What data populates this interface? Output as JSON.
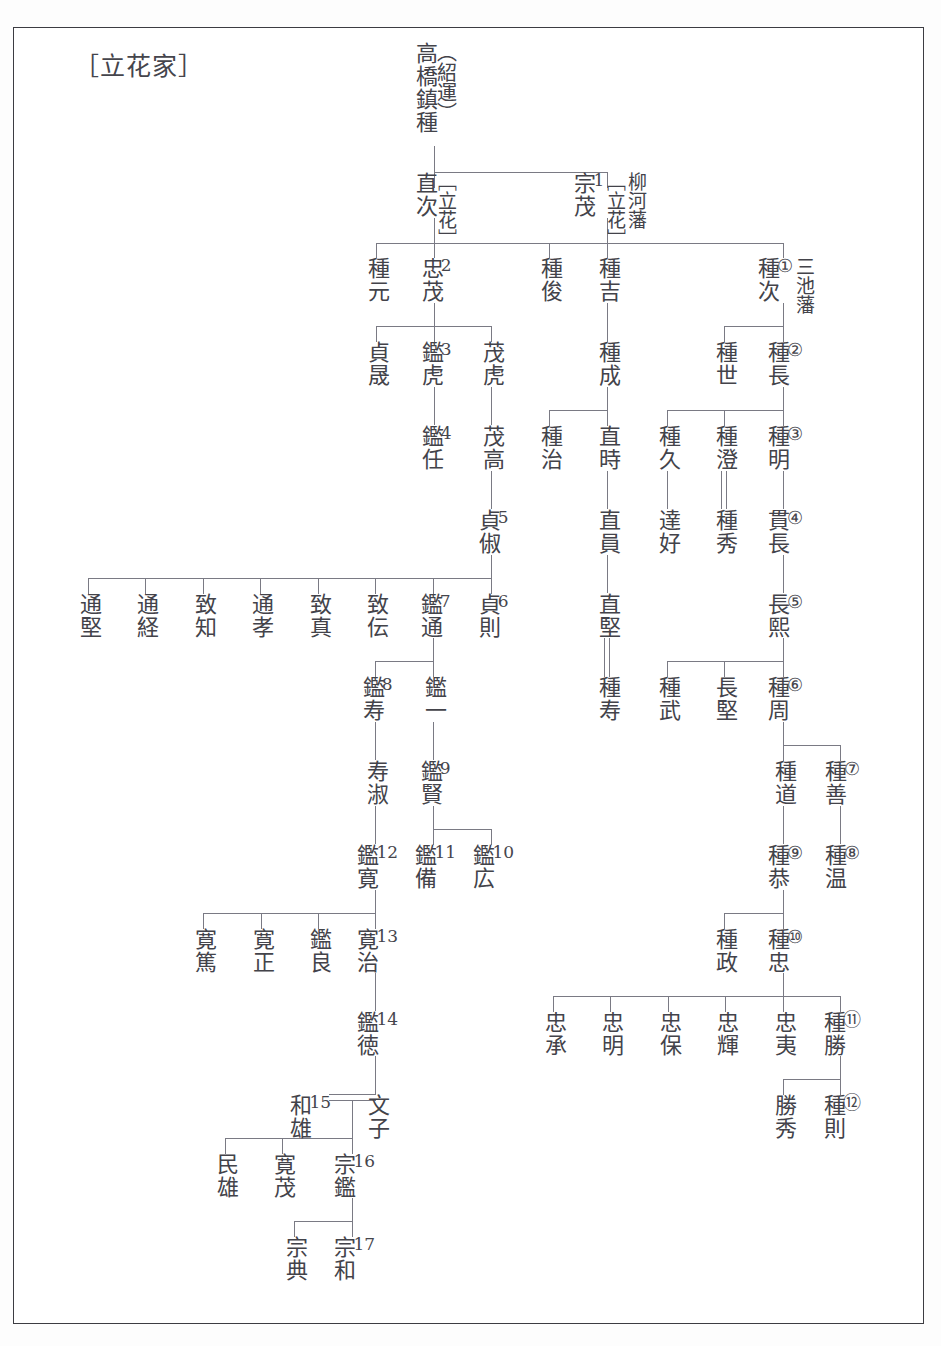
{
  "document": {
    "title": "［立花家］",
    "type": "family-tree",
    "orientation": "vertical-japanese"
  },
  "legend": {
    "domain_label_yanagawa": "柳河藩",
    "domain_label_miike": "三池藩",
    "surname_bracket": "［立花］"
  },
  "nodes": {
    "root": {
      "name": "高橋鎮種",
      "alt": "（紹運）"
    },
    "naotsugu": {
      "name": "直次",
      "tag": "［立花］"
    },
    "muneshige": {
      "name": "宗茂",
      "gen": "1",
      "tag": "［立花］",
      "tag2": "柳河藩"
    },
    "tanemoto": {
      "name": "種元"
    },
    "tadashige": {
      "name": "忠茂",
      "gen": "2"
    },
    "tanetoshi": {
      "name": "種俊"
    },
    "taneyoshi": {
      "name": "種吉"
    },
    "tanetsugu": {
      "name": "種次",
      "circ": "①",
      "tag2": "三池藩"
    },
    "sadaakira": {
      "name": "貞晟"
    },
    "akitora": {
      "name": "鑑虎",
      "gen": "3"
    },
    "shigetora": {
      "name": "茂虎"
    },
    "tanenari": {
      "name": "種成"
    },
    "taneyo": {
      "name": "種世"
    },
    "tanenaga": {
      "name": "種長",
      "circ": "②"
    },
    "akitou": {
      "name": "鑑任",
      "gen": "4"
    },
    "shigetaka": {
      "name": "茂高"
    },
    "taneharu": {
      "name": "種治"
    },
    "naotoki": {
      "name": "直時"
    },
    "tanehisa": {
      "name": "種久"
    },
    "tanesumi": {
      "name": "種澄"
    },
    "taneaki": {
      "name": "種明",
      "circ": "③"
    },
    "sadayoshi": {
      "name": "貞俶",
      "gen": "5"
    },
    "naokazu": {
      "name": "直員"
    },
    "tatsuyoshi": {
      "name": "達好"
    },
    "tanehide": {
      "name": "種秀"
    },
    "tsuranaga": {
      "name": "貫長",
      "circ": "④"
    },
    "michikata": {
      "name": "通堅"
    },
    "michitsune": {
      "name": "通経"
    },
    "muneyuki": {
      "name": "致知"
    },
    "michitaka": {
      "name": "通孝"
    },
    "munezane": {
      "name": "致真"
    },
    "munetsutau": {
      "name": "致伝"
    },
    "akimichi": {
      "name": "鑑通",
      "gen": "7"
    },
    "sadanori": {
      "name": "貞則",
      "gen": "6"
    },
    "naokata": {
      "name": "直堅"
    },
    "nagahiro": {
      "name": "長熙",
      "circ": "⑤"
    },
    "akitoshi": {
      "name": "鑑寿",
      "gen": "8"
    },
    "akikazu": {
      "name": "鑑一"
    },
    "tanehisashi": {
      "name": "種寿"
    },
    "tanetake": {
      "name": "種武"
    },
    "nagakata": {
      "name": "長堅"
    },
    "tanechika": {
      "name": "種周",
      "circ": "⑥"
    },
    "toshiyoshi": {
      "name": "寿淑"
    },
    "akikata": {
      "name": "鑑賢",
      "gen": "9"
    },
    "tanemichi": {
      "name": "種道"
    },
    "taneyoshi2": {
      "name": "種善",
      "circ": "⑦"
    },
    "akihiro": {
      "name": "鑑寛",
      "gen": "12"
    },
    "akitomo": {
      "name": "鑑備",
      "gen": "11"
    },
    "akihiro2": {
      "name": "鑑広",
      "gen": "10"
    },
    "taneyasu": {
      "name": "種恭",
      "circ": "⑨"
    },
    "taneatsu": {
      "name": "種温",
      "circ": "⑧"
    },
    "hiroatsu": {
      "name": "寛篤"
    },
    "hiromasa": {
      "name": "寛正"
    },
    "akiyoshi": {
      "name": "鑑良"
    },
    "hiroharu": {
      "name": "寛治",
      "gen": "13"
    },
    "tanemasa": {
      "name": "種政"
    },
    "tanetada": {
      "name": "種忠",
      "circ": "⑩"
    },
    "akinori": {
      "name": "鑑徳",
      "gen": "14"
    },
    "tadatsugu": {
      "name": "忠承"
    },
    "tadaaki": {
      "name": "忠明"
    },
    "tadayasu": {
      "name": "忠保"
    },
    "tadateru": {
      "name": "忠輝"
    },
    "tadahira": {
      "name": "忠夷"
    },
    "tanekatsu": {
      "name": "種勝",
      "circ": "⑪"
    },
    "kazuo": {
      "name": "和雄",
      "gen": "15"
    },
    "fumiko": {
      "name": "文子"
    },
    "katsuhide": {
      "name": "勝秀"
    },
    "tanenori": {
      "name": "種則",
      "circ": "⑫"
    },
    "tamio": {
      "name": "民雄"
    },
    "hiroshige": {
      "name": "寛茂"
    },
    "muneaki": {
      "name": "宗鑑",
      "gen": "16"
    },
    "munenori": {
      "name": "宗典"
    },
    "munekazu": {
      "name": "宗和",
      "gen": "17"
    }
  },
  "colors": {
    "ink": "#43434a",
    "line": "#7a7a84",
    "border": "#3c3c42",
    "paper": "#ffffff"
  }
}
